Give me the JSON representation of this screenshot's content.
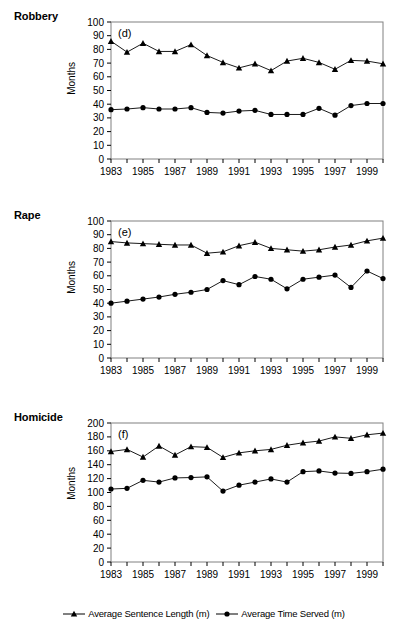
{
  "figure": {
    "axis_label": "Months",
    "panels_order": [
      "robbery",
      "rape",
      "homicide"
    ]
  },
  "legend": {
    "position": "bottom-center",
    "entries": [
      {
        "label": "Average Sentence Length (m)",
        "marker": "triangle-up-marker",
        "color": "#000000"
      },
      {
        "label": "Average Time Served (m)",
        "marker": "circle-marker",
        "color": "#000000"
      }
    ]
  },
  "chart_data": [
    {
      "id": "robbery",
      "type": "line",
      "title": "Robbery",
      "panel_label": "(d)",
      "xlabel": "",
      "ylabel": "Months",
      "ylim": [
        0,
        100
      ],
      "ytick_step": 10,
      "yticks": [
        0,
        10,
        20,
        30,
        40,
        50,
        60,
        70,
        80,
        90,
        100
      ],
      "grid": false,
      "x": [
        1983,
        1984,
        1985,
        1986,
        1987,
        1988,
        1989,
        1990,
        1991,
        1992,
        1993,
        1994,
        1995,
        1996,
        1997,
        1998,
        1999,
        2000
      ],
      "xticks": [
        1983,
        1985,
        1987,
        1989,
        1991,
        1993,
        1995,
        1997,
        1999
      ],
      "xtick_labels": [
        "1983",
        "1985",
        "1987",
        "1989",
        "1991",
        "1993",
        "1995",
        "1997",
        "1999"
      ],
      "series": [
        {
          "name": "Average Sentence Length (m)",
          "marker": "triangle-up-marker",
          "values": [
            86,
            78,
            84.5,
            78.5,
            78.5,
            83.5,
            75.5,
            70.5,
            66.5,
            69.5,
            64.5,
            71.5,
            73.5,
            70.5,
            65.5,
            72,
            71.5,
            69.5
          ]
        },
        {
          "name": "Average Time Served (m)",
          "marker": "circle-marker",
          "values": [
            36,
            36.5,
            37.5,
            36.5,
            36.5,
            37.5,
            34,
            33.5,
            35,
            35.5,
            32.5,
            32.5,
            32.5,
            37,
            32,
            39,
            40.5,
            40.5
          ]
        }
      ]
    },
    {
      "id": "rape",
      "type": "line",
      "title": "Rape",
      "panel_label": "(e)",
      "xlabel": "",
      "ylabel": "Months",
      "ylim": [
        0,
        100
      ],
      "ytick_step": 10,
      "yticks": [
        0,
        10,
        20,
        30,
        40,
        50,
        60,
        70,
        80,
        90,
        100
      ],
      "grid": false,
      "x": [
        1983,
        1984,
        1985,
        1986,
        1987,
        1988,
        1989,
        1990,
        1991,
        1992,
        1993,
        1994,
        1995,
        1996,
        1997,
        1998,
        1999,
        2000
      ],
      "xticks": [
        1983,
        1985,
        1987,
        1989,
        1991,
        1993,
        1995,
        1997,
        1999
      ],
      "xtick_labels": [
        "1983",
        "1985",
        "1987",
        "1989",
        "1991",
        "1993",
        "1995",
        "1997",
        "1999"
      ],
      "series": [
        {
          "name": "Average Sentence Length (m)",
          "marker": "triangle-up-marker",
          "values": [
            85,
            84,
            83.5,
            83,
            82.5,
            82.5,
            76.5,
            77.5,
            82,
            84.5,
            80,
            79,
            78,
            79,
            81,
            82.5,
            85.5,
            87.5
          ]
        },
        {
          "name": "Average Time Served (m)",
          "marker": "circle-marker",
          "values": [
            40,
            41.5,
            43,
            44.5,
            46.5,
            48,
            50,
            56.5,
            53.5,
            59.5,
            57.5,
            50.5,
            57.5,
            59,
            60.5,
            51.5,
            63.5,
            58
          ]
        }
      ]
    },
    {
      "id": "homicide",
      "type": "line",
      "title": "Homicide",
      "panel_label": "(f)",
      "xlabel": "",
      "ylabel": "Months",
      "ylim": [
        0,
        200
      ],
      "ytick_step": 20,
      "yticks": [
        0,
        20,
        40,
        60,
        80,
        100,
        120,
        140,
        160,
        180,
        200
      ],
      "grid": false,
      "x": [
        1983,
        1984,
        1985,
        1986,
        1987,
        1988,
        1989,
        1990,
        1991,
        1992,
        1993,
        1994,
        1995,
        1996,
        1997,
        1998,
        1999,
        2000
      ],
      "xticks": [
        1983,
        1985,
        1987,
        1989,
        1991,
        1993,
        1995,
        1997,
        1999
      ],
      "xtick_labels": [
        "1983",
        "1985",
        "1987",
        "1989",
        "1991",
        "1993",
        "1995",
        "1997",
        "1999"
      ],
      "series": [
        {
          "name": "Average Sentence Length (m)",
          "marker": "triangle-up-marker",
          "values": [
            159,
            162,
            151,
            167,
            154,
            166,
            165,
            150.5,
            157,
            160,
            162,
            168,
            171.5,
            174,
            180,
            178,
            183,
            185.5
          ]
        },
        {
          "name": "Average Time Served (m)",
          "marker": "circle-marker",
          "values": [
            105,
            106,
            117.5,
            115,
            121,
            121.5,
            122.5,
            102,
            110.5,
            115,
            119.5,
            115,
            130,
            131,
            128,
            127.5,
            130,
            133.5
          ]
        }
      ]
    }
  ]
}
